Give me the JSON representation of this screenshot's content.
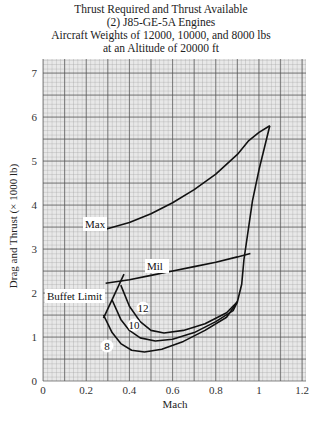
{
  "chart_data": {
    "type": "line",
    "title": "Thrust Required and Thrust Available",
    "subtitle_lines": [
      "(2) J85-GE-5A Engines",
      "Aircraft Weights of 12000, 10000, and 8000 lbs",
      "at an Altitude of 20000 ft"
    ],
    "xlabel": "Mach",
    "ylabel": "Drag and Thrust (× 1000 lb)",
    "xlim": [
      0,
      1.25
    ],
    "ylim": [
      0,
      7.3
    ],
    "xticks": [
      "0",
      "0.2",
      "0.4",
      "0.6",
      "0.8",
      "1",
      "1.2"
    ],
    "yticks": [
      "0",
      "1",
      "2",
      "3",
      "4",
      "5",
      "6",
      "7"
    ],
    "grid": true,
    "series": [
      {
        "name": "Max",
        "label": "Max",
        "x": [
          0.29,
          0.4,
          0.5,
          0.6,
          0.7,
          0.8,
          0.9,
          0.95,
          1.0,
          1.05
        ],
        "y": [
          3.45,
          3.6,
          3.8,
          4.05,
          4.35,
          4.7,
          5.15,
          5.45,
          5.65,
          5.8
        ]
      },
      {
        "name": "Mil",
        "label": "Mil",
        "x": [
          0.29,
          0.4,
          0.5,
          0.6,
          0.7,
          0.8,
          0.9,
          0.96
        ],
        "y": [
          2.22,
          2.3,
          2.4,
          2.5,
          2.6,
          2.7,
          2.82,
          2.9
        ]
      },
      {
        "name": "Thrust Required 12000 lb",
        "label": "12",
        "x": [
          0.36,
          0.4,
          0.45,
          0.5,
          0.56,
          0.65,
          0.75,
          0.85,
          0.9,
          0.92,
          0.93,
          0.97,
          1.0,
          1.05
        ],
        "y": [
          2.18,
          1.7,
          1.35,
          1.15,
          1.09,
          1.15,
          1.3,
          1.55,
          1.8,
          2.2,
          2.75,
          4.1,
          4.8,
          5.8
        ]
      },
      {
        "name": "Thrust Required 10000 lb",
        "label": "10",
        "x": [
          0.32,
          0.36,
          0.4,
          0.45,
          0.52,
          0.6,
          0.7,
          0.8,
          0.88,
          0.9
        ],
        "y": [
          1.84,
          1.4,
          1.15,
          0.98,
          0.91,
          0.95,
          1.1,
          1.35,
          1.6,
          1.8
        ]
      },
      {
        "name": "Thrust Required 8000 lb",
        "label": "8",
        "x": [
          0.28,
          0.32,
          0.36,
          0.41,
          0.47,
          0.55,
          0.65,
          0.75,
          0.85,
          0.9
        ],
        "y": [
          1.5,
          1.1,
          0.85,
          0.7,
          0.66,
          0.72,
          0.9,
          1.15,
          1.45,
          1.8
        ]
      },
      {
        "name": "Buffet Limit",
        "label": "Buffet Limit",
        "x": [
          0.28,
          0.375
        ],
        "y": [
          1.43,
          2.43
        ]
      }
    ],
    "annotations": [
      "Max",
      "Mil",
      "Buffet Limit",
      "12",
      "10",
      "8"
    ]
  },
  "labels": {
    "title": "Thrust Required and Thrust Available",
    "line2": "(2) J85-GE-5A Engines",
    "line3": "Aircraft Weights of 12000, 10000, and 8000 lbs",
    "line4": "at an Altitude of 20000 ft",
    "xlabel": "Mach",
    "ylabel": "Drag and Thrust (× 1000 lb)"
  }
}
